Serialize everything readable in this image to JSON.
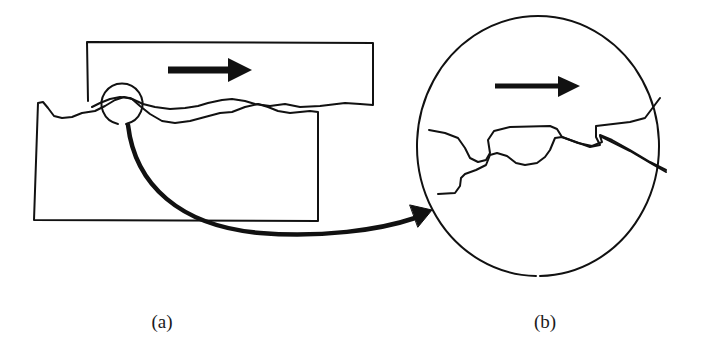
{
  "figure": {
    "type": "schematic",
    "stroke_color": "#111111",
    "background_color": "#ffffff",
    "panels": [
      {
        "id": "a",
        "label": "(a)",
        "elements": [
          "upper-block",
          "lower-block",
          "sliding-direction-arrow",
          "magnifier-circle",
          "connector-arrow"
        ]
      },
      {
        "id": "b",
        "label": "(b)",
        "elements": [
          "magnified-view-circle",
          "sliding-direction-arrow",
          "interlocking-asperities"
        ]
      }
    ],
    "arrows": {
      "sliding_direction": "right",
      "connector": "curved from magnifier circle in (a) to enlarged view (b)"
    }
  },
  "captions": {
    "a": "(a)",
    "b": "(b)"
  }
}
